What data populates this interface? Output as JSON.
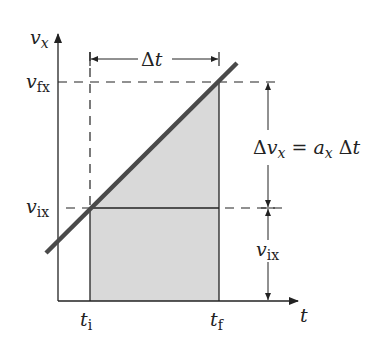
{
  "diagram": {
    "axes": {
      "y_label": "v",
      "y_label_sub": "x",
      "x_label": "t"
    },
    "y_ticks": [
      {
        "main": "v",
        "sub": "fx"
      },
      {
        "main": "v",
        "sub": "ix"
      }
    ],
    "x_ticks": [
      {
        "main": "t",
        "sub": "i"
      },
      {
        "main": "t",
        "sub": "f"
      }
    ],
    "delta_t": {
      "delta": "Δ",
      "var": "t"
    },
    "equation": {
      "delta": "Δ",
      "lhs_var": "v",
      "lhs_sub": "x",
      "equals": " = ",
      "rhs_var": "a",
      "rhs_sub": "x",
      "rhs_delta": " Δ",
      "rhs_t": "t"
    },
    "vix_dim": {
      "main": "v",
      "sub": "ix"
    },
    "colors": {
      "line": "#4a4a4a",
      "shade": "#d6d6d6",
      "ink": "#222222"
    }
  }
}
